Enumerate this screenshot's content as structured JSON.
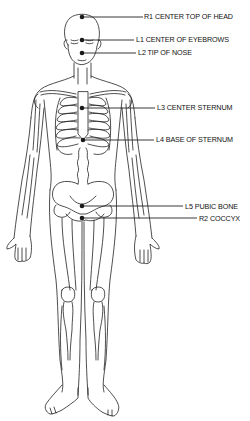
{
  "diagram": {
    "title": "",
    "colors": {
      "line": "#222222",
      "dot": "#1a1a1a",
      "background": "#ffffff"
    },
    "points": [
      {
        "id": "R1",
        "code": "R1",
        "text": "CENTER TOP OF HEAD",
        "label": "R1 CENTER TOP OF HEAD",
        "dot": [
          82,
          17
        ],
        "line_end": 143,
        "label_x": 144,
        "label_y": 13
      },
      {
        "id": "L1",
        "code": "L1",
        "text": "CENTER OF EYEBROWS",
        "label": "L1  CENTER OF EYEBROWS",
        "dot": [
          82,
          40
        ],
        "line_end": 134,
        "label_x": 136,
        "label_y": 36
      },
      {
        "id": "L2",
        "code": "L2",
        "text": "TIP OF NOSE",
        "label": "L2  TIP OF NOSE",
        "dot": [
          82,
          53
        ],
        "line_end": 136,
        "label_x": 138,
        "label_y": 49
      },
      {
        "id": "L3",
        "code": "L3",
        "text": "CENTER STERNUM",
        "label": "L3  CENTER STERNUM",
        "dot": [
          82,
          108
        ],
        "line_end": 155,
        "label_x": 157,
        "label_y": 104
      },
      {
        "id": "L4",
        "code": "L4",
        "text": "BASE OF STERNUM",
        "label": "L4  BASE OF STERNUM",
        "dot": [
          83,
          140
        ],
        "line_end": 154,
        "label_x": 156,
        "label_y": 136
      },
      {
        "id": "L5",
        "code": "L5",
        "text": "PUBIC BONE",
        "label": "L5  PUBIC BONE",
        "dot": [
          82,
          206
        ],
        "line_end": 183,
        "label_x": 185,
        "label_y": 203
      },
      {
        "id": "R2",
        "code": "R2",
        "text": "COCCYX",
        "label": "R2  COCCYX",
        "dot": [
          82,
          218
        ],
        "line_end": 197,
        "label_x": 199,
        "label_y": 215
      }
    ]
  }
}
